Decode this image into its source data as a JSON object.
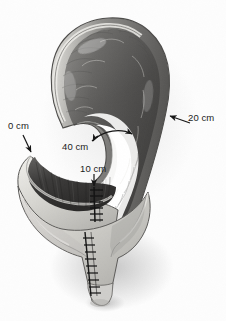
{
  "figure": {
    "background_color": "#fdfdfd",
    "width": 226,
    "height": 321,
    "style": "grayscale anatomical photograph illustration"
  },
  "annotations": [
    {
      "id": "zero-cm",
      "text": "0 cm",
      "marker": "arrow",
      "points_to": "proximal blind end of the left-hand bowel pouch"
    },
    {
      "id": "twenty-cm",
      "text": "20 cm",
      "marker": "arrow",
      "points_to": "outer right wall of the descending limb"
    },
    {
      "id": "forty-cm",
      "text": "40 cm",
      "marker": "curved-double-arrow",
      "points_to": "span across the inner bend of the loop"
    },
    {
      "id": "ten-cm",
      "text": "10 cm",
      "marker": "arrow",
      "points_to": "upper staple / suture line at the anastomosis"
    }
  ],
  "structures": {
    "upper_loop": "inverted U-shaped bowel loop with longitudinal serosal striations",
    "left_pouch": "opened left-side bowel pouch showing dark mucosal surface",
    "lower_pouch": "tapering distal pouch ending in a narrow tip",
    "suture_lines": [
      {
        "id": "upper-staple-line",
        "description": "short ladder-like staple line below the 10 cm arrow"
      },
      {
        "id": "lower-staple-line",
        "description": "long ladder-like staple line running down the distal pouch"
      }
    ]
  },
  "colors": {
    "tissue_mid": "#8d8d8d",
    "tissue_dark": "#3a3a3a",
    "tissue_light": "#d8d8d6",
    "serosa_highlight": "#e9e8e4",
    "outline": "#4a4a4a",
    "label_text": "#1b1b1b",
    "background": "#fdfdfd"
  }
}
